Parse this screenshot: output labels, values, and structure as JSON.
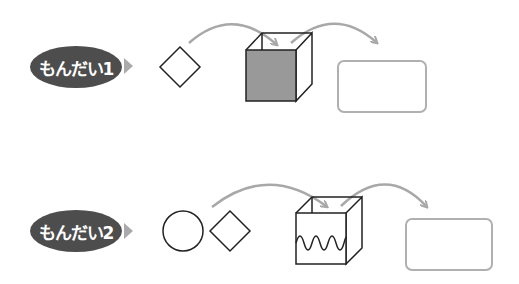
{
  "problems": [
    {
      "label": "もんだい1",
      "inputs": [
        "diamond"
      ],
      "box_front": "gray-filled",
      "output": "empty-rounded-rect"
    },
    {
      "label": "もんだい2",
      "inputs": [
        "circle",
        "diamond"
      ],
      "box_front": "wavy-line",
      "output": "empty-rounded-rect"
    }
  ],
  "colors": {
    "pill": "#4d4d4d",
    "pill_text": "#ffffff",
    "pointer": "#aaaaaa",
    "arrow": "#a8a8a8",
    "box_fill": "#999999",
    "stroke": "#222222",
    "answer_box": "#b0b0b0"
  }
}
